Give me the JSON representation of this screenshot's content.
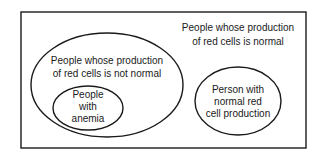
{
  "diagram": {
    "type": "venn",
    "universe": {
      "label_lines": [
        "People whose production",
        "of red cells is normal"
      ]
    },
    "sets": [
      {
        "id": "not-normal",
        "label_lines": [
          "People whose production",
          "of red cells is not normal"
        ],
        "subsets": [
          {
            "id": "anemia",
            "label_lines": [
              "People",
              "with",
              "anemia"
            ]
          }
        ]
      },
      {
        "id": "normal-person",
        "label_lines": [
          "Person with",
          "normal red",
          "cell production"
        ]
      }
    ]
  }
}
